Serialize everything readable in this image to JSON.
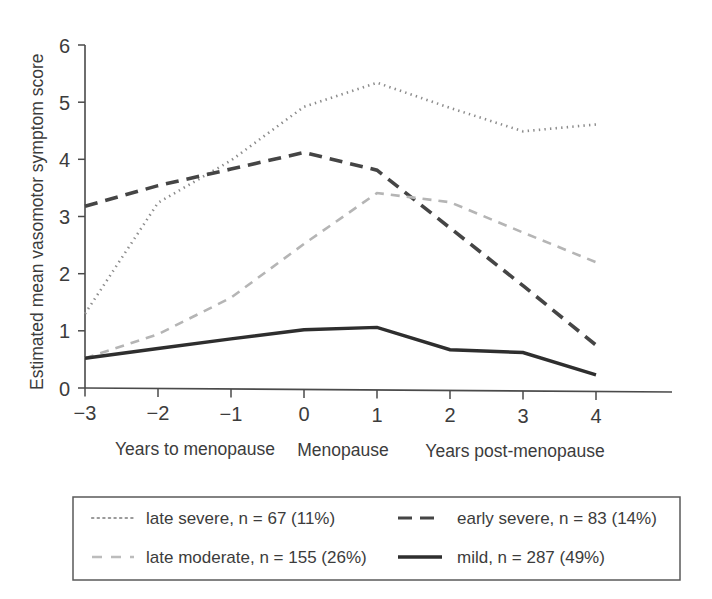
{
  "chart_data": {
    "type": "line",
    "title": "",
    "xlabel": "",
    "ylabel": "Estimated mean vasomotor symptom score",
    "x": [
      -3,
      -2,
      -1,
      0,
      1,
      2,
      3,
      4
    ],
    "xtick_labels": [
      "−3",
      "−2",
      "−1",
      "0",
      "1",
      "2",
      "3",
      "4"
    ],
    "ytick_labels": [
      "0",
      "1",
      "2",
      "3",
      "4",
      "5",
      "6"
    ],
    "xlim": [
      -3,
      4
    ],
    "ylim": [
      0,
      6
    ],
    "grid": false,
    "legend_position": "below-plot",
    "x_axis_captions": [
      "Years to menopause",
      "Menopause",
      "Years post-menopause"
    ],
    "series": [
      {
        "name": "late severe",
        "label": "late severe, n = 67 (11%)",
        "n": 67,
        "percent": "11%",
        "style": "dotted",
        "color": "#8c8c8c",
        "values": [
          1.3,
          3.25,
          4.0,
          4.95,
          5.38,
          4.95,
          4.55,
          4.68
        ]
      },
      {
        "name": "early severe",
        "label": "early severe, n = 83 (14%)",
        "n": 83,
        "percent": "14%",
        "style": "dashed",
        "color": "#454545",
        "values": [
          3.18,
          3.55,
          3.85,
          4.15,
          3.85,
          2.85,
          1.85,
          0.82
        ]
      },
      {
        "name": "late moderate",
        "label": "late moderate, n = 155 (26%)",
        "n": 155,
        "percent": "26%",
        "style": "dashed-light",
        "color": "#b5b5b5",
        "values": [
          0.52,
          0.95,
          1.6,
          2.55,
          3.45,
          3.3,
          2.78,
          2.27
        ]
      },
      {
        "name": "mild",
        "label": "mild, n = 287 (49%)",
        "n": 287,
        "percent": "49%",
        "style": "solid",
        "color": "#2e2e2e",
        "values": [
          0.52,
          0.7,
          0.88,
          1.05,
          1.1,
          0.72,
          0.68,
          0.3
        ]
      }
    ]
  },
  "legend": {
    "entries": [
      {
        "label": "late severe, n = 67 (11%)",
        "swatch": "dotted-line-swatch"
      },
      {
        "label": "early severe, n = 83 (14%)",
        "swatch": "dashed-line-swatch"
      },
      {
        "label": "late moderate, n = 155 (26%)",
        "swatch": "dashed-light-line-swatch"
      },
      {
        "label": "mild, n = 287 (49%)",
        "swatch": "solid-line-swatch"
      }
    ]
  }
}
